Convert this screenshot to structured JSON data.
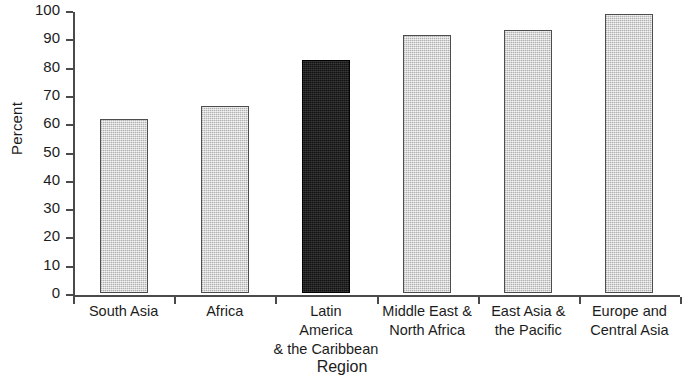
{
  "chart_data": {
    "type": "bar",
    "title": "",
    "xlabel": "Region",
    "ylabel": "Percent",
    "categories": [
      "South Asia",
      "Africa",
      "Latin\nAmerica\n& the Caribbean",
      "Middle East &\nNorth Africa",
      "East Asia &\nthe Pacific",
      "Europe and\nCentral Asia"
    ],
    "values": [
      61.5,
      66,
      82.5,
      91,
      93,
      98.5
    ],
    "ylim": [
      0,
      100
    ],
    "yticks": [
      0,
      10,
      20,
      30,
      40,
      50,
      60,
      70,
      80,
      90,
      100
    ],
    "ytick_labels": [
      "0",
      "10",
      "20",
      "30",
      "40",
      "50",
      "60",
      "70",
      "80",
      "90",
      "100"
    ],
    "grid": false,
    "legend": "none",
    "bar_colors": [
      "#c8c8c8",
      "#c8c8c8",
      "#1f1f1f",
      "#c8c8c8",
      "#c8c8c8",
      "#c8c8c8"
    ],
    "highlight_category": "Latin America & the Caribbean",
    "axis_color": "#4a4a4a",
    "bar_edge_color": "#4d4d4d"
  }
}
